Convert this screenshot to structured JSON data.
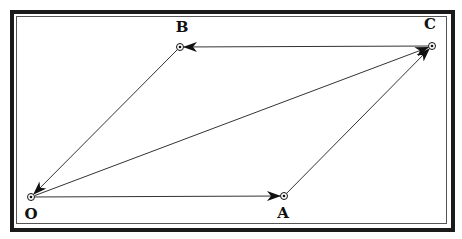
{
  "diagram": {
    "type": "vector-parallelogram",
    "points": [
      {
        "id": "O",
        "label": "O",
        "x": 31,
        "y": 197,
        "lx": 31,
        "ly": 219
      },
      {
        "id": "A",
        "label": "A",
        "x": 284,
        "y": 196,
        "lx": 283,
        "ly": 218
      },
      {
        "id": "B",
        "label": "B",
        "x": 180,
        "y": 47,
        "lx": 182,
        "ly": 32
      },
      {
        "id": "C",
        "label": "C",
        "x": 432,
        "y": 46,
        "lx": 430,
        "ly": 29
      }
    ],
    "vectors": [
      {
        "from": "O",
        "to": "A"
      },
      {
        "from": "A",
        "to": "C"
      },
      {
        "from": "C",
        "to": "B"
      },
      {
        "from": "B",
        "to": "O"
      },
      {
        "from": "O",
        "to": "C"
      }
    ],
    "colors": {
      "line": "#333333",
      "arrow": "#111111",
      "frame": "#1a1a1a"
    }
  }
}
